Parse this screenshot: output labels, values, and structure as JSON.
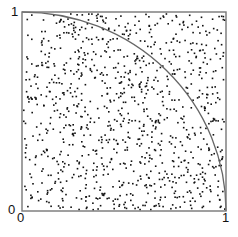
{
  "chart_data": {
    "type": "scatter",
    "title": "",
    "xlabel": "",
    "ylabel": "",
    "xlim": [
      0,
      1
    ],
    "ylim": [
      0,
      1
    ],
    "grid": false,
    "legend": null,
    "tick_labels": {
      "x": [
        "0",
        "1"
      ],
      "y": [
        "0",
        "1"
      ]
    },
    "series": [
      {
        "name": "random points",
        "kind": "points",
        "count": 1000,
        "distribution": "uniform on unit square",
        "seed": 12345,
        "color": "#111111"
      },
      {
        "name": "quarter circle",
        "kind": "curve",
        "equation": "x^2 + y^2 = 1",
        "color": "#666666"
      }
    ],
    "annotations": [
      "Monte Carlo estimation of pi: points inside quarter circle"
    ]
  },
  "labels": {
    "y_top": "1",
    "y_origin": "0",
    "x_origin": "0",
    "x_right": "1"
  },
  "frame": {
    "left": 22,
    "top": 12,
    "right": 226,
    "bottom": 211,
    "color": "#777777"
  }
}
